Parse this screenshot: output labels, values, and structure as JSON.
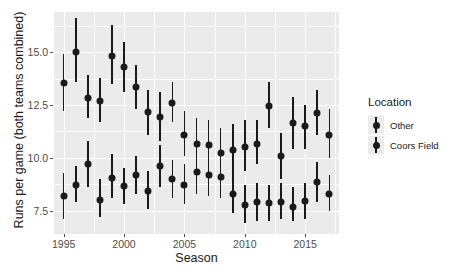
{
  "chart_data": {
    "type": "scatter",
    "title": "",
    "xlabel": "Season",
    "ylabel": "Runs per game (both teams combined)",
    "xlim": [
      1994.2,
      2017.8
    ],
    "ylim": [
      6.4,
      16.9
    ],
    "xticks": [
      1995,
      2000,
      2005,
      2010,
      2015
    ],
    "yticks": [
      7.5,
      10.0,
      12.5,
      15.0
    ],
    "ytick_labels": [
      "7.5",
      "10.0",
      "12.5",
      "15.0"
    ],
    "xtick_labels": [
      "1995",
      "2000",
      "2005",
      "2010",
      "2015"
    ],
    "grid": true,
    "legend_position": "right",
    "legend_title": "Location",
    "marker": "point-with-errorbar",
    "series": [
      {
        "name": "Coors Field",
        "x": [
          1995,
          1996,
          1997,
          1998,
          1999,
          2000,
          2001,
          2002,
          2003,
          2004,
          2005,
          2006,
          2007,
          2008,
          2009,
          2010,
          2011,
          2012,
          2013,
          2014,
          2015,
          2016,
          2017
        ],
        "values": [
          13.55,
          15.0,
          12.85,
          12.7,
          14.8,
          14.3,
          13.35,
          12.15,
          11.95,
          12.6,
          11.1,
          10.65,
          10.6,
          10.25,
          10.35,
          10.5,
          10.65,
          12.45,
          10.1,
          11.65,
          11.5,
          12.1,
          11.1
        ],
        "ymin": [
          12.2,
          13.6,
          11.9,
          11.7,
          13.5,
          13.1,
          12.3,
          11.1,
          10.8,
          11.7,
          10.1,
          9.5,
          9.5,
          9.2,
          9.2,
          9.4,
          9.7,
          11.4,
          9.0,
          10.4,
          10.4,
          11.1,
          10.0
        ],
        "ymax": [
          14.9,
          16.6,
          13.9,
          13.8,
          16.3,
          15.5,
          14.4,
          13.2,
          13.1,
          13.6,
          12.2,
          11.9,
          11.8,
          11.4,
          11.6,
          11.8,
          11.8,
          13.6,
          11.2,
          12.9,
          12.5,
          13.2,
          12.3
        ]
      },
      {
        "name": "Other",
        "x": [
          1995,
          1996,
          1997,
          1998,
          1999,
          2000,
          2001,
          2002,
          2003,
          2004,
          2005,
          2006,
          2007,
          2008,
          2009,
          2010,
          2011,
          2012,
          2013,
          2014,
          2015,
          2016,
          2017
        ],
        "values": [
          8.2,
          8.7,
          9.7,
          8.0,
          9.05,
          8.65,
          9.2,
          8.45,
          9.6,
          9.0,
          8.7,
          9.35,
          9.2,
          9.1,
          8.3,
          7.75,
          7.9,
          7.85,
          7.9,
          7.7,
          7.95,
          8.85,
          8.3
        ],
        "ymin": [
          7.1,
          7.9,
          8.6,
          7.2,
          8.1,
          7.8,
          8.3,
          7.6,
          8.6,
          8.1,
          7.8,
          8.3,
          8.2,
          8.1,
          7.4,
          6.9,
          7.0,
          7.0,
          7.1,
          7.0,
          7.1,
          7.9,
          7.5
        ],
        "ymax": [
          9.3,
          9.6,
          10.8,
          9.0,
          10.2,
          9.5,
          10.1,
          9.4,
          10.6,
          9.9,
          9.7,
          10.5,
          10.2,
          10.2,
          9.3,
          8.7,
          8.8,
          8.7,
          8.8,
          8.6,
          8.8,
          9.8,
          9.2
        ]
      }
    ]
  },
  "axis": {
    "xlabel": "Season",
    "ylabel": "Runs per game (both teams combined)"
  },
  "legend": {
    "title": "Location",
    "items": [
      {
        "label": "Other",
        "color": "#1a1a1a"
      },
      {
        "label": "Coors Field",
        "color": "#1a1a1a"
      }
    ]
  },
  "style": {
    "panel_bg": "#ebebeb",
    "grid_color": "#ffffff",
    "mark_color": "#1a1a1a",
    "tick_text_color": "#4d4d4d"
  }
}
